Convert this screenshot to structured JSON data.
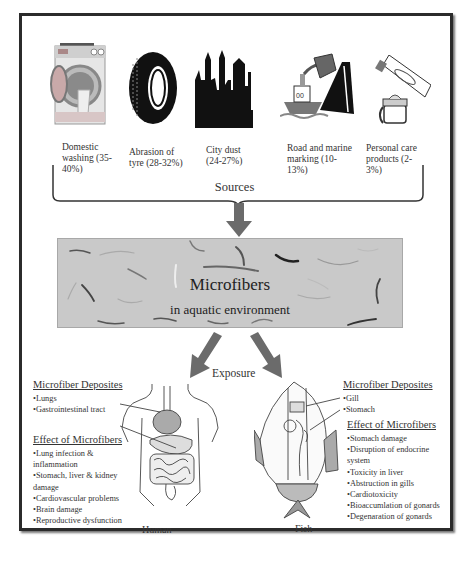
{
  "sources": {
    "items": [
      {
        "icon": "washing-machine-icon",
        "label_lines": [
          "Domestic",
          "washing (35-",
          "40%)"
        ],
        "percent_range": "35-40%"
      },
      {
        "icon": "tyre-icon",
        "label_lines": [
          "Abrasion of",
          "tyre (28-32%)"
        ],
        "percent_range": "28-32%"
      },
      {
        "icon": "city-skyline-icon",
        "label_lines": [
          "City dust",
          "(24-27%)"
        ],
        "percent_range": "24-27%"
      },
      {
        "icon": "ship-and-road-icon",
        "label_lines": [
          "Road and marine",
          "marking (10-",
          "13%)"
        ],
        "percent_range": "10-13%"
      },
      {
        "icon": "toothpaste-cream-icon",
        "label_lines": [
          "Personal care",
          "products (2-",
          "3%)"
        ],
        "percent_range": "2-3%"
      }
    ],
    "group_label": "Sources"
  },
  "environment": {
    "title": "Microfibers",
    "subtitle": "in aquatic environment",
    "colors": {
      "box": "#c9c9c9",
      "arrow": "#6b6b6b"
    }
  },
  "exposure_label": "Exposure",
  "human": {
    "deposits_title": "Microfiber Deposites",
    "deposits": [
      "•Lungs",
      "•Gastrointestinal tract"
    ],
    "effects_title": "Effect of Microfibers",
    "effects": [
      "•Lung infection &",
      "inflammation",
      "•Stomach, liver & kidney",
      "damage",
      "•Cardiovascular problems",
      "•Brain damage",
      "•Reproductive dysfunction"
    ],
    "caption": "Human"
  },
  "fish": {
    "deposits_title": "Microfiber Deposites",
    "deposits": [
      "•Gill",
      "•Stomach"
    ],
    "effects_title": "Effect of  Microfibers",
    "effects": [
      "•Stomach damage",
      "•Disruption of endocrine",
      "system",
      "•Toxicity in liver",
      "•Abstruction in gills",
      "•Cardiotoxicity",
      "•Bioaccumlation of gonards",
      "•Degenaration of gonards"
    ],
    "caption": "Fish"
  }
}
